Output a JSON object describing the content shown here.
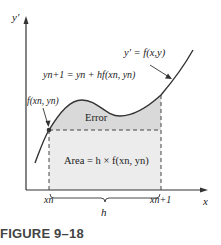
{
  "figure": {
    "caption": "FIGURE 9–18",
    "axes": {
      "y_label": "y′",
      "x_label": "x"
    },
    "labels": {
      "ode": "y′ = f(x,y)",
      "euler_formula": "yn+1 = yn + hf(xn, yn)",
      "point": "f(xn, yn)",
      "error": "Error",
      "area": "Area = h × f(xn, yn)",
      "xn": "xn",
      "xn1": "xn+1",
      "h": "h"
    },
    "colors": {
      "error_fill": "#d9d9d9",
      "area_fill": "#ececec",
      "curve": "#333333",
      "axis": "#333333"
    }
  }
}
